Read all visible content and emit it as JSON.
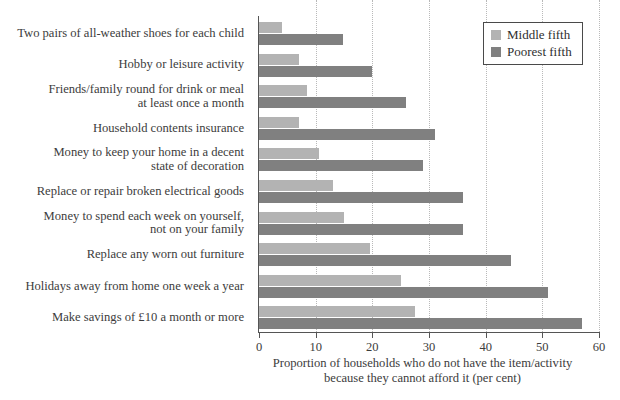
{
  "chart_data": {
    "type": "bar",
    "orientation": "horizontal",
    "title": "",
    "subtitle": "",
    "xlabel_lines": [
      "Proportion of households who do not have the item/activity",
      "because they cannot afford it (per cent)"
    ],
    "ylabel": "",
    "xlim": [
      0,
      60
    ],
    "xticks": [
      0,
      10,
      20,
      30,
      40,
      50,
      60
    ],
    "xtick_labels": [
      "0",
      "10",
      "20",
      "30",
      "40",
      "50",
      "60"
    ],
    "grid": "vertical-dotted",
    "legend_position": "top-right",
    "categories": [
      "Two pairs of all-weather shoes for each child",
      "Hobby or leisure activity",
      "Friends/family round for drink or meal\nat least once a month",
      "Household contents insurance",
      "Money to keep your home in a decent\nstate of decoration",
      "Replace or repair broken electrical goods",
      "Money to spend each week on yourself,\nnot on your family",
      "Replace any worn out furniture",
      "Holidays away from home one week a year",
      "Make savings of £10 a month or more"
    ],
    "series": [
      {
        "name": "Middle fifth",
        "color": "#b3b3b3",
        "values": [
          4,
          7,
          8.5,
          7,
          10.5,
          13,
          15,
          19.5,
          25,
          27.5
        ]
      },
      {
        "name": "Poorest fifth",
        "color": "#808080",
        "values": [
          14.8,
          20,
          26,
          31,
          29,
          36,
          36,
          44.5,
          51,
          57
        ]
      }
    ]
  },
  "legend": {
    "entries": [
      {
        "label": "Middle fifth"
      },
      {
        "label": "Poorest fifth"
      }
    ]
  },
  "colors": {
    "middle_fifth": "#b3b3b3",
    "poorest_fifth": "#808080",
    "axis": "#555555",
    "gridline": "#b9b9b9",
    "text": "#3c3c3c",
    "background": "#ffffff"
  }
}
